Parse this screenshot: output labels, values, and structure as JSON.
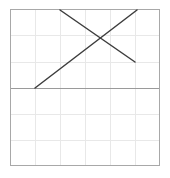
{
  "chart_data": {
    "type": "line",
    "title": "",
    "subtitle": "",
    "xlabel": "",
    "ylabel": "",
    "grid": true,
    "legend": false,
    "legend_position": "none",
    "tick_labels_x": [],
    "tick_labels_y": [],
    "xlim": [
      0,
      6
    ],
    "ylim": [
      -3,
      3
    ],
    "axis_lines": {
      "x_axis_y_value": 0,
      "x_axis_drawn": true,
      "y_axis_drawn": false
    },
    "grid_columns": 6,
    "grid_rows": 6,
    "series": [
      {
        "name": "ascending-segment",
        "type": "segment",
        "points": [
          [
            1,
            0
          ],
          [
            5.1,
            3
          ]
        ],
        "color": "#3d3d3d"
      },
      {
        "name": "descending-segment",
        "type": "segment",
        "points": [
          [
            2,
            3
          ],
          [
            5,
            0.95
          ]
        ],
        "color": "#3d3d3d"
      }
    ],
    "intersection": [
      3.72,
      2.0
    ],
    "annotations": []
  },
  "figure": {
    "background_color": "#ffffff",
    "border_color": "#a8a8a8",
    "grid_color": "#e8e8e8",
    "axis_color": "#9a9a9a",
    "line_color": "#3d3d3d",
    "plot_area": {
      "left": 10,
      "top": 9,
      "right": 160,
      "bottom": 166,
      "width": 150,
      "height": 157
    },
    "geometry": {
      "vertical_gridlines_x": [
        35,
        60,
        85,
        110,
        135
      ],
      "horizontal_gridlines_y": [
        35,
        61.5,
        114,
        140
      ],
      "axis_y": 88,
      "segment_a": {
        "x1": 35,
        "y1": 88,
        "x2": 137,
        "y2": 10
      },
      "segment_b": {
        "x1": 60,
        "y1": 10,
        "x2": 135,
        "y2": 62
      }
    }
  }
}
